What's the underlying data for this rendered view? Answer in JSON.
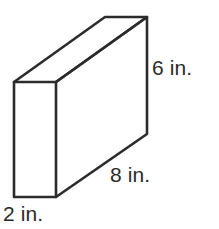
{
  "figure": {
    "kind": "rectangular-prism-diagram",
    "background_color": "#ffffff",
    "line_color": "#2b2b2b",
    "text_color": "#2b2b2b",
    "labels": {
      "height": "6 in.",
      "length": "8 in.",
      "depth": "2 in."
    },
    "dimensions": {
      "height_value": 6,
      "length_value": 8,
      "depth_value": 2,
      "unit": "in."
    }
  }
}
